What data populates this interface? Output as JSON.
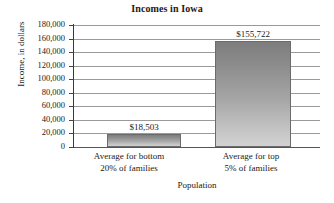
{
  "chart_data": {
    "type": "bar",
    "title": "Incomes in Iowa",
    "xlabel": "Population",
    "ylabel": "Income, in dollars",
    "categories": [
      "Average for bottom 20% of families",
      "Average for top 5% of families"
    ],
    "category_lines": [
      [
        "Average for bottom",
        "20% of families"
      ],
      [
        "Average for top",
        "5% of families"
      ]
    ],
    "values": [
      18503,
      155722
    ],
    "data_labels": [
      "$18,503",
      "$155,722"
    ],
    "ylim": [
      0,
      180000
    ],
    "ytick_step": 20000,
    "ytick_labels": [
      "180,000",
      "160,000",
      "140,000",
      "120,000",
      "100,000",
      "80,000",
      "60,000",
      "40,000",
      "20,000",
      "0"
    ],
    "ytick_values": [
      180000,
      160000,
      140000,
      120000,
      100000,
      80000,
      60000,
      40000,
      20000,
      0
    ],
    "grid": true,
    "grid_orientation": "horizontal",
    "legend": null,
    "bar_color_top": "#7d7d7d",
    "bar_color_bottom": "#d2d2d2",
    "bar_border_color": "#6b6b6b",
    "gridline_color": "#9a9a9a",
    "axis_color": "#3a3a3a",
    "background": "#ffffff"
  }
}
